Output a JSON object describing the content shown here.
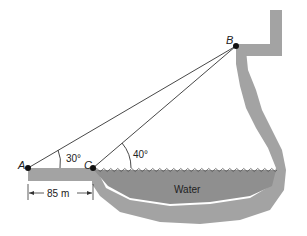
{
  "diagram": {
    "points": {
      "A": {
        "label": "A"
      },
      "B": {
        "label": "B"
      },
      "C": {
        "label": "C"
      }
    },
    "angles": {
      "at_A": "30°",
      "at_C": "40°"
    },
    "distance_AC": "85 m",
    "water_label": "Water",
    "colors": {
      "terrain": "#a3a3a3",
      "water": "#8f8f8f",
      "lines": "#333333",
      "points": "#111111"
    }
  }
}
